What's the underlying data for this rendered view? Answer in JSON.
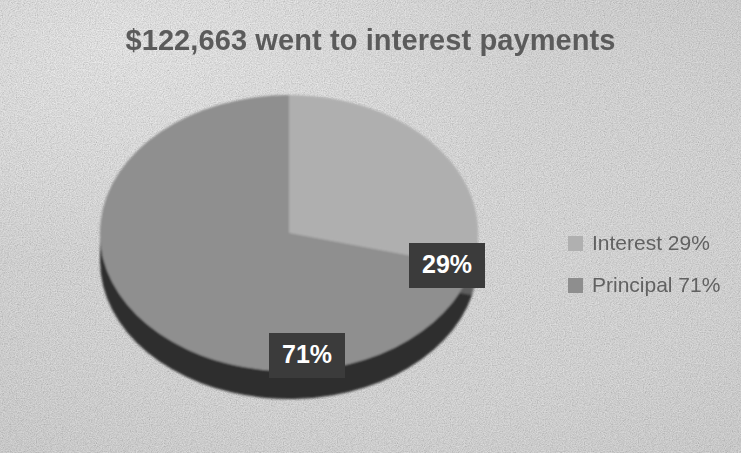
{
  "chart_data": {
    "type": "pie",
    "title": "$122,663 went to interest payments",
    "xlabel": "",
    "ylabel": "",
    "categories": [
      "Interest",
      "Principal"
    ],
    "values": [
      29,
      71
    ],
    "value_unit": "percent",
    "data_labels": [
      "29%",
      "71%"
    ],
    "legend_entries": [
      "Interest 29%",
      "Principal 71%"
    ],
    "legend_position": "right",
    "grid": false,
    "three_d": true,
    "start_angle_deg": 0,
    "direction": "clockwise",
    "slice_colors": [
      "#b0b0b0",
      "#8e8e8e"
    ],
    "slice_side_colors": [
      "#6e6e6e",
      "#2e2e2e"
    ],
    "background_color": "#ebebeb",
    "title_color": "#5b5b5b",
    "label_text_color": "#ffffff",
    "label_box_color": "#3b3b3b",
    "legend_text_color": "#616161"
  },
  "chart": {
    "title": "$122,663 went to interest payments"
  },
  "labels": {
    "interest": "29%",
    "principal": "71%"
  },
  "legend": {
    "items": [
      {
        "label": "Interest 29%",
        "color": "#b0b0b0"
      },
      {
        "label": "Principal 71%",
        "color": "#8e8e8e"
      }
    ]
  }
}
